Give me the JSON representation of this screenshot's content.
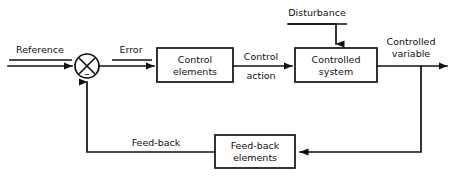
{
  "diagram": {
    "type": "block-diagram",
    "canvas": {
      "width": 456,
      "height": 176
    },
    "colors": {
      "stroke": "#111111",
      "background": "#ffffff",
      "text": "#111111"
    },
    "blocks": [
      {
        "id": "control-elements",
        "line1": "Control",
        "line2": "elements",
        "x": 157,
        "y": 48,
        "w": 76,
        "h": 34
      },
      {
        "id": "controlled-system",
        "line1": "Controlled",
        "line2": "system",
        "x": 295,
        "y": 48,
        "w": 82,
        "h": 34
      },
      {
        "id": "feedback-elements",
        "line1": "Feed-back",
        "line2": "elements",
        "x": 215,
        "y": 135,
        "w": 80,
        "h": 33
      }
    ],
    "summing_junction": {
      "id": "summing-junction",
      "cx": 87,
      "cy": 66,
      "r": 12,
      "negative_sign": "–",
      "style": "crossed-circle"
    },
    "signals": {
      "reference": {
        "label": "Reference",
        "underlined": true
      },
      "error": {
        "label": "Error",
        "underlined": true
      },
      "control_action": {
        "line1": "Control",
        "line2": "action"
      },
      "disturbance": {
        "label": "Disturbance",
        "underlined": true
      },
      "controlled_variable": {
        "line1": "Controlled",
        "line2": "variable"
      },
      "feedback": {
        "label": "Feed-back",
        "underlined": false
      }
    }
  }
}
